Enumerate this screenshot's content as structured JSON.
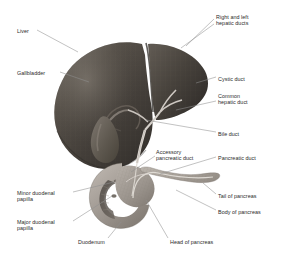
{
  "figure": {
    "background_color": "#ffffff",
    "label_color": "#2a2a2a",
    "leader_color": "#8f8f8f",
    "structures": {
      "liver_color": "#4b4642",
      "liver_highlight": "#6e6862",
      "gallbladder_color": "#6d6761",
      "duodenum_color": "#a39c96",
      "pancreas_color": "#b3aca6",
      "duct_color": "#d9d4cf"
    }
  },
  "labels": [
    {
      "id": "liver",
      "text": "Liver",
      "align": "left",
      "x": 17,
      "y": 28
    },
    {
      "id": "gallbladder",
      "text": "Gallbladder",
      "align": "left",
      "x": 17,
      "y": 70
    },
    {
      "id": "right-and-left-hepatic-ducts",
      "text": "Right and left\nhepatic ducts",
      "align": "left",
      "x": 216,
      "y": 14
    },
    {
      "id": "cystic-duct",
      "text": "Cystic duct",
      "align": "left",
      "x": 218,
      "y": 76
    },
    {
      "id": "common-hepatic-duct",
      "text": "Common\nhepatic duct",
      "align": "left",
      "x": 218,
      "y": 93
    },
    {
      "id": "bile-duct",
      "text": "Bile duct",
      "align": "left",
      "x": 218,
      "y": 131
    },
    {
      "id": "accessory-pancreatic-duct",
      "text": "Accessory\npancreatic duct",
      "align": "left",
      "x": 156,
      "y": 149
    },
    {
      "id": "pancreatic-duct",
      "text": "Pancreatic duct",
      "align": "left",
      "x": 218,
      "y": 155
    },
    {
      "id": "tail-of-pancreas",
      "text": "Tail of pancreas",
      "align": "left",
      "x": 218,
      "y": 193
    },
    {
      "id": "body-of-pancreas",
      "text": "Body of pancreas",
      "align": "left",
      "x": 218,
      "y": 209
    },
    {
      "id": "minor-duodenal-papilla",
      "text": "Minor duodenal\npapilla",
      "align": "left",
      "x": 17,
      "y": 190
    },
    {
      "id": "major-duodenal-papilla",
      "text": "Major duodenal\npapilla",
      "align": "left",
      "x": 17,
      "y": 219
    },
    {
      "id": "duodenum",
      "text": "Duodenum",
      "align": "left",
      "x": 78,
      "y": 239
    },
    {
      "id": "head-of-pancreas",
      "text": "Head of pancreas",
      "align": "left",
      "x": 170,
      "y": 239
    }
  ],
  "leader_lines": [
    {
      "id": "leader-liver",
      "from": [
        37,
        30
      ],
      "to": [
        78,
        52
      ]
    },
    {
      "id": "leader-gallbladder",
      "from": [
        60,
        72
      ],
      "to": [
        89,
        82
      ]
    },
    {
      "id": "leader-hepatic-ducts-a",
      "from": [
        214,
        19
      ],
      "to": [
        186,
        46
      ]
    },
    {
      "id": "leader-hepatic-ducts-b",
      "from": [
        214,
        24
      ],
      "to": [
        181,
        48
      ]
    },
    {
      "id": "leader-cystic-duct",
      "from": [
        216,
        77
      ],
      "to": [
        196,
        83
      ]
    },
    {
      "id": "leader-common-hepatic-duct",
      "from": [
        216,
        101
      ],
      "to": [
        176,
        110
      ]
    },
    {
      "id": "leader-bile-duct",
      "from": [
        216,
        132
      ],
      "to": [
        146,
        120
      ]
    },
    {
      "id": "leader-accessory-pancreatic-duct",
      "from": [
        155,
        156
      ],
      "to": [
        131,
        172
      ]
    },
    {
      "id": "leader-pancreatic-duct",
      "from": [
        216,
        157
      ],
      "to": [
        160,
        174
      ]
    },
    {
      "id": "leader-tail-of-pancreas",
      "from": [
        216,
        194
      ],
      "to": [
        203,
        183
      ]
    },
    {
      "id": "leader-body-of-pancreas",
      "from": [
        216,
        210
      ],
      "to": [
        176,
        190
      ]
    },
    {
      "id": "leader-minor-duodenal-papilla",
      "from": [
        73,
        192
      ],
      "to": [
        114,
        182
      ]
    },
    {
      "id": "leader-major-duodenal-papilla",
      "from": [
        73,
        221
      ],
      "to": [
        112,
        196
      ]
    },
    {
      "id": "leader-duodenum",
      "from": [
        108,
        238
      ],
      "to": [
        121,
        222
      ]
    },
    {
      "id": "leader-head-of-pancreas",
      "from": [
        168,
        238
      ],
      "to": [
        146,
        200
      ]
    }
  ]
}
